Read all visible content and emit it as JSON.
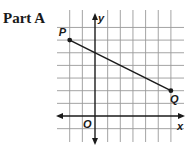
{
  "part_label": "Part A",
  "graph": {
    "origin_px": [
      95,
      116
    ],
    "unit_px": 12.65,
    "grid": {
      "x_min": -2,
      "x_max": 6,
      "y_min": -1,
      "y_max": 7,
      "h_line_extent_px": [
        57,
        184
      ],
      "v_line_extent_px": [
        10,
        142
      ]
    },
    "axes": {
      "x_label": "x",
      "y_label": "y",
      "origin_label": "O"
    },
    "segment": {
      "points": [
        {
          "label": "P",
          "x": -2,
          "y": 6
        },
        {
          "label": "Q",
          "x": 6,
          "y": 2
        }
      ]
    },
    "colors": {
      "grid": "#9a9a9a",
      "ink": "#1a1a1a"
    }
  }
}
